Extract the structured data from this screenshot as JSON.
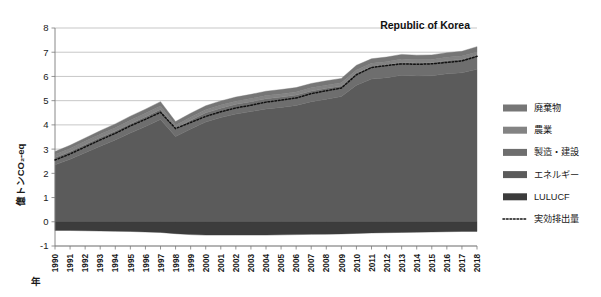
{
  "chart_data": {
    "type": "area",
    "title": "Republic of Korea",
    "subtitle": "",
    "xlabel": "年",
    "ylabel": "億トンCO₂-eq",
    "stacked": true,
    "grid": true,
    "legend_position": "right",
    "xlim": [
      1990,
      2018
    ],
    "ylim": [
      -1,
      8
    ],
    "ytick_labels": [
      "8",
      "7",
      "6",
      "5",
      "4",
      "3",
      "2",
      "1",
      "0",
      "-1"
    ],
    "ytick_values": [
      8,
      7,
      6,
      5,
      4,
      3,
      2,
      1,
      0,
      -1
    ],
    "categories": [
      1990,
      1991,
      1992,
      1993,
      1994,
      1995,
      1996,
      1997,
      1998,
      1999,
      2000,
      2001,
      2002,
      2003,
      2004,
      2005,
      2006,
      2007,
      2008,
      2009,
      2010,
      2011,
      2012,
      2013,
      2014,
      2015,
      2016,
      2017,
      2018
    ],
    "x": [
      "1990",
      "1991",
      "1992",
      "1993",
      "1994",
      "1995",
      "1996",
      "1997",
      "1998",
      "1999",
      "2000",
      "2001",
      "2002",
      "2003",
      "2004",
      "2005",
      "2006",
      "2007",
      "2008",
      "2009",
      "2010",
      "2011",
      "2012",
      "2013",
      "2014",
      "2015",
      "2016",
      "2017",
      "2018"
    ],
    "series": [
      {
        "name": "エネルギー",
        "color": "#5b5b5b",
        "values": [
          2.35,
          2.58,
          2.85,
          3.12,
          3.38,
          3.66,
          3.93,
          4.22,
          3.52,
          3.83,
          4.12,
          4.3,
          4.45,
          4.55,
          4.66,
          4.72,
          4.8,
          4.96,
          5.06,
          5.17,
          5.64,
          5.89,
          5.95,
          6.05,
          6.02,
          6.03,
          6.11,
          6.15,
          6.3
        ]
      },
      {
        "name": "製造・建設",
        "color": "#6e6e6e",
        "values": [
          0.3,
          0.32,
          0.34,
          0.36,
          0.37,
          0.39,
          0.41,
          0.42,
          0.33,
          0.36,
          0.38,
          0.39,
          0.4,
          0.41,
          0.42,
          0.43,
          0.43,
          0.44,
          0.45,
          0.44,
          0.5,
          0.52,
          0.53,
          0.54,
          0.54,
          0.54,
          0.55,
          0.56,
          0.58
        ]
      },
      {
        "name": "農業",
        "color": "#838383",
        "values": [
          0.13,
          0.13,
          0.13,
          0.13,
          0.13,
          0.14,
          0.14,
          0.14,
          0.13,
          0.13,
          0.13,
          0.13,
          0.13,
          0.13,
          0.13,
          0.13,
          0.13,
          0.13,
          0.13,
          0.13,
          0.13,
          0.13,
          0.13,
          0.13,
          0.13,
          0.13,
          0.13,
          0.13,
          0.13
        ]
      },
      {
        "name": "廃棄物",
        "color": "#767676",
        "values": [
          0.12,
          0.13,
          0.14,
          0.15,
          0.16,
          0.17,
          0.17,
          0.18,
          0.16,
          0.16,
          0.16,
          0.17,
          0.17,
          0.17,
          0.18,
          0.18,
          0.18,
          0.18,
          0.18,
          0.18,
          0.19,
          0.19,
          0.19,
          0.19,
          0.19,
          0.19,
          0.19,
          0.2,
          0.22
        ]
      },
      {
        "name": "LULUCF",
        "color": "#3c3c3c",
        "values": [
          -0.36,
          -0.36,
          -0.37,
          -0.38,
          -0.39,
          -0.4,
          -0.42,
          -0.44,
          -0.49,
          -0.53,
          -0.55,
          -0.55,
          -0.55,
          -0.55,
          -0.55,
          -0.54,
          -0.53,
          -0.52,
          -0.51,
          -0.5,
          -0.48,
          -0.46,
          -0.45,
          -0.44,
          -0.43,
          -0.42,
          -0.41,
          -0.4,
          -0.4
        ]
      }
    ],
    "net_line": {
      "name": "実効排出量",
      "style": "dotted",
      "color": "#111111",
      "values": [
        2.55,
        2.8,
        3.09,
        3.38,
        3.65,
        3.96,
        4.23,
        4.52,
        3.85,
        4.1,
        4.35,
        4.54,
        4.7,
        4.81,
        4.94,
        5.02,
        5.11,
        5.29,
        5.41,
        5.52,
        6.07,
        6.37,
        6.45,
        6.52,
        6.5,
        6.52,
        6.58,
        6.64,
        6.83
      ]
    }
  },
  "legend": {
    "items": [
      {
        "label": "廃棄物",
        "color": "#767676",
        "type": "swatch"
      },
      {
        "label": "農業",
        "color": "#838383",
        "type": "swatch"
      },
      {
        "label": "製造・建設",
        "color": "#6e6e6e",
        "type": "swatch"
      },
      {
        "label": "エネルギー",
        "color": "#5b5b5b",
        "type": "swatch"
      },
      {
        "label": "LULUCF",
        "color": "#3c3c3c",
        "type": "swatch"
      },
      {
        "label": "実効排出量",
        "color": "#111111",
        "type": "dotted-line"
      }
    ]
  }
}
